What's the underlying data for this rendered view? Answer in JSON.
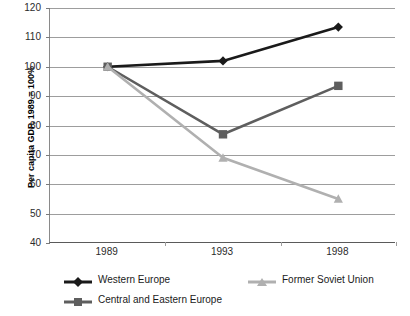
{
  "chart_data": {
    "type": "line",
    "title": "",
    "subtitle": "",
    "xlabel": "",
    "ylabel": "Per capita GDP, 1989 = 100%",
    "x": [
      "1989",
      "1993",
      "1998"
    ],
    "categories": [
      "1989",
      "1993",
      "1998"
    ],
    "ylim": [
      40,
      120
    ],
    "y_ticks": [
      40,
      50,
      60,
      70,
      80,
      90,
      100,
      110,
      120
    ],
    "y_tick_labels": [
      "40",
      "50",
      "60",
      "70",
      "80",
      "90",
      "100",
      "110",
      "120"
    ],
    "grid": true,
    "legend_position": "bottom",
    "series": [
      {
        "name": "Western Europe",
        "values": [
          100,
          102,
          113.5
        ],
        "color": "#1a1a1a",
        "marker": "diamond"
      },
      {
        "name": "Central and Eastern Europe",
        "values": [
          100,
          77,
          93.5
        ],
        "color": "#5e5e5e",
        "marker": "square"
      },
      {
        "name": "Former Soviet Union",
        "values": [
          100,
          69,
          55
        ],
        "color": "#b0b0b0",
        "marker": "triangle"
      }
    ]
  },
  "axes": {
    "y_title": "Per capita GDP, 1989 = 100%",
    "y_tick_labels": [
      "120",
      "110",
      "100",
      "90",
      "80",
      "70",
      "60",
      "50",
      "40"
    ],
    "x_tick_labels": [
      "1989",
      "1993",
      "1998"
    ]
  },
  "legend": {
    "items": [
      {
        "label": "Western Europe",
        "color": "#1a1a1a",
        "marker": "diamond"
      },
      {
        "label": "Central and Eastern Europe",
        "color": "#5e5e5e",
        "marker": "square"
      },
      {
        "label": "Former Soviet Union",
        "color": "#b0b0b0",
        "marker": "triangle"
      }
    ]
  },
  "colors": {
    "western_europe": "#1a1a1a",
    "central_eastern_europe": "#5e5e5e",
    "former_soviet_union": "#b0b0b0",
    "gridline": "#9d9d9d",
    "axis": "#5a5a5a",
    "background": "#ffffff"
  }
}
